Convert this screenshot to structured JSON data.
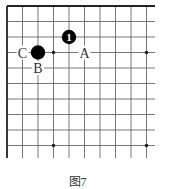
{
  "diagram": {
    "type": "go-board-fragment",
    "columns": 10,
    "rows": 10,
    "corner": "top-left",
    "star_points": [
      [
        3,
        3
      ],
      [
        9,
        3
      ],
      [
        3,
        9
      ],
      [
        9,
        9
      ]
    ],
    "stones": [
      {
        "col": 4,
        "row": 2,
        "color": "black",
        "label": "1"
      },
      {
        "col": 2,
        "row": 3,
        "color": "black",
        "label": ""
      }
    ],
    "markers": [
      {
        "col": 1,
        "row": 3,
        "text": "C"
      },
      {
        "col": 5,
        "row": 3,
        "text": "A"
      },
      {
        "col": 2,
        "row": 4,
        "text": "B"
      }
    ],
    "colors": {
      "line": "#555555",
      "border": "#222222",
      "stone": "#000000",
      "stone_text": "#ffffff",
      "marker_text": "#333333"
    }
  },
  "caption": "图7"
}
